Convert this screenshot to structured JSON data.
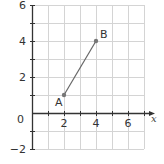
{
  "chart_data": {
    "type": "line",
    "title": "",
    "xlabel": "x",
    "ylabel": "",
    "xlim": [
      0,
      7
    ],
    "ylim": [
      -2,
      6
    ],
    "grid": true,
    "x_ticks": [
      "2",
      "4",
      "6"
    ],
    "y_ticks": [
      "-2",
      "2",
      "4",
      "6"
    ],
    "origin_label": "0",
    "series": [
      {
        "name": "AB",
        "points": [
          {
            "label": "A",
            "x": 2,
            "y": 1
          },
          {
            "label": "B",
            "x": 4,
            "y": 4
          }
        ]
      }
    ]
  },
  "colors": {
    "grid": "#d4d4d4",
    "axis": "#333333",
    "segment": "#666666",
    "point": "#777777"
  }
}
